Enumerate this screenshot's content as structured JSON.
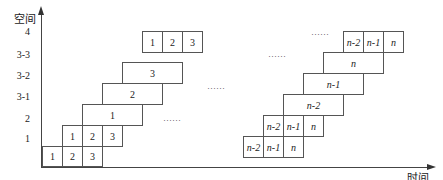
{
  "axes": {
    "y_title": "空间",
    "x_title": "时间",
    "y_labels": [
      "4",
      "3-3",
      "3-2",
      "3-1",
      "2",
      "1"
    ]
  },
  "rows": {
    "r1_left": [
      "1",
      "2",
      "3"
    ],
    "r2_left": [
      "1",
      "2",
      "3"
    ],
    "r31_left": "1",
    "r32_left": "2",
    "r33_left": "3",
    "r4_left": [
      "1",
      "2",
      "3"
    ],
    "r1_right": [
      "n-2",
      "n-1",
      "n"
    ],
    "r2_right": [
      "n-2",
      "n-1",
      "n"
    ],
    "r31_right": "n-2",
    "r32_right": "n-1",
    "r33_right": "n",
    "r4_right": [
      "n-2",
      "n-1",
      "n"
    ]
  },
  "ellipsis": "……"
}
